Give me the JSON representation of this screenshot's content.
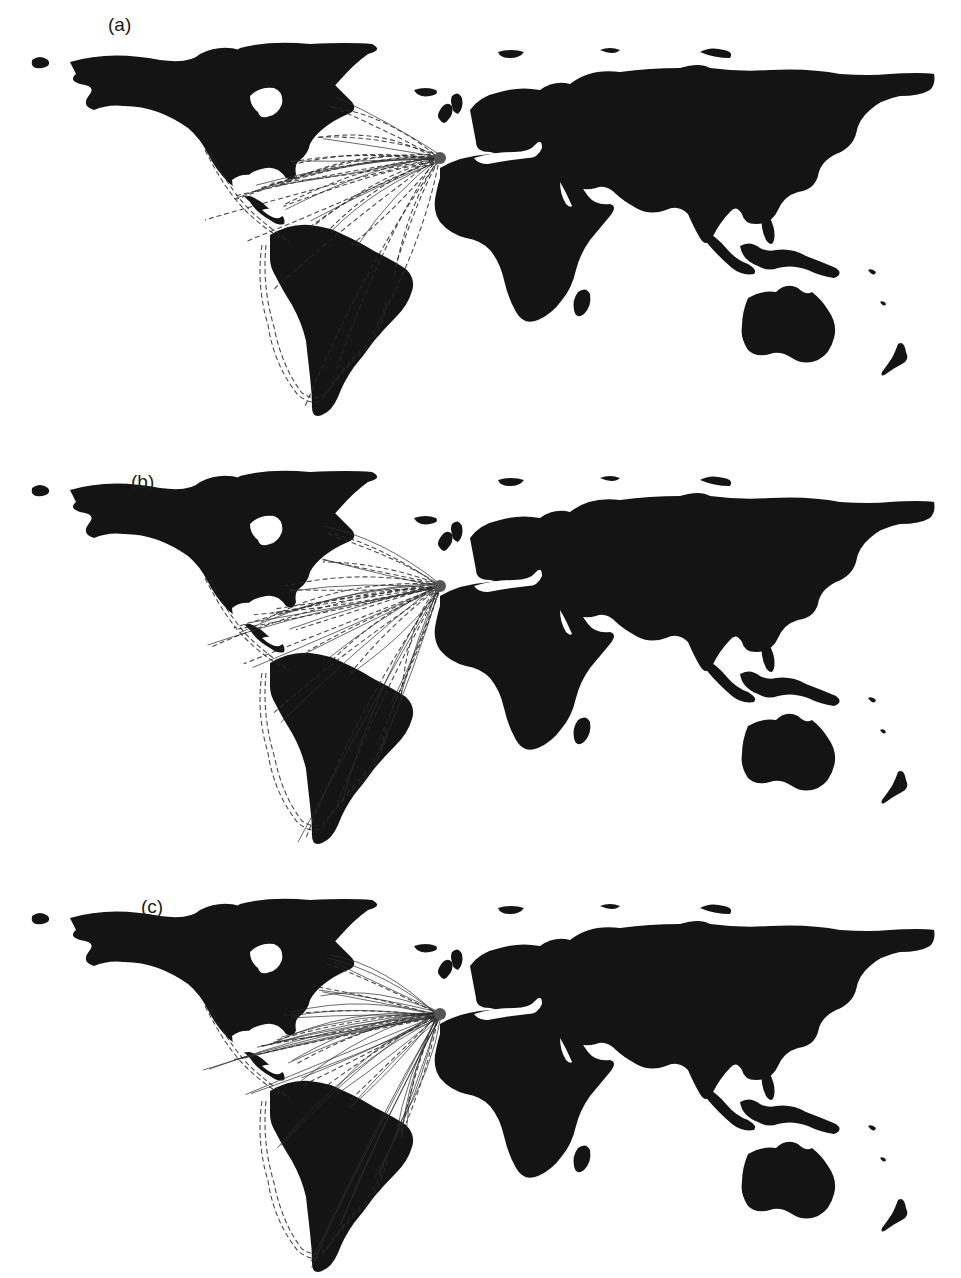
{
  "figure": {
    "panels": [
      {
        "id": "a",
        "label": "(a)",
        "top": 0,
        "label_x": 108,
        "label_y": 8,
        "dashed_routes": 26,
        "solid_routes": 10
      },
      {
        "id": "b",
        "label": "(b)",
        "top": 420,
        "label_x": 130,
        "label_y": 468,
        "dashed_routes": 24,
        "solid_routes": 18
      },
      {
        "id": "c",
        "label": "(c)",
        "top": 850,
        "label_x": 140,
        "label_y": 895,
        "dashed_routes": 12,
        "solid_routes": 40
      }
    ],
    "colors": {
      "land": "#141414",
      "route": "#2a2a2a",
      "background": "#ffffff",
      "port": "#555555"
    },
    "origin_port": {
      "name": "Iberian peninsula / Cadiz",
      "x": 440,
      "y": 158
    },
    "destinations": [
      {
        "name": "Newfoundland",
        "x": 330,
        "y": 102
      },
      {
        "name": "New England",
        "x": 320,
        "y": 135
      },
      {
        "name": "Chesapeake",
        "x": 290,
        "y": 160
      },
      {
        "name": "Florida",
        "x": 275,
        "y": 185
      },
      {
        "name": "Havana",
        "x": 258,
        "y": 190
      },
      {
        "name": "Veracruz",
        "x": 240,
        "y": 200
      },
      {
        "name": "Hispaniola",
        "x": 290,
        "y": 205
      },
      {
        "name": "Cartagena",
        "x": 305,
        "y": 225
      },
      {
        "name": "Caracas",
        "x": 330,
        "y": 235
      },
      {
        "name": "Guianas",
        "x": 355,
        "y": 248
      },
      {
        "name": "Pernambuco",
        "x": 400,
        "y": 270
      },
      {
        "name": "Bahia",
        "x": 395,
        "y": 280
      },
      {
        "name": "Rio de Janeiro",
        "x": 380,
        "y": 320
      },
      {
        "name": "Rio de la Plata",
        "x": 340,
        "y": 370
      },
      {
        "name": "Cape Horn",
        "x": 305,
        "y": 410
      },
      {
        "name": "Peru coast",
        "x": 275,
        "y": 290
      },
      {
        "name": "Panama Pacific",
        "x": 250,
        "y": 240
      },
      {
        "name": "Acapulco",
        "x": 205,
        "y": 215
      }
    ]
  }
}
